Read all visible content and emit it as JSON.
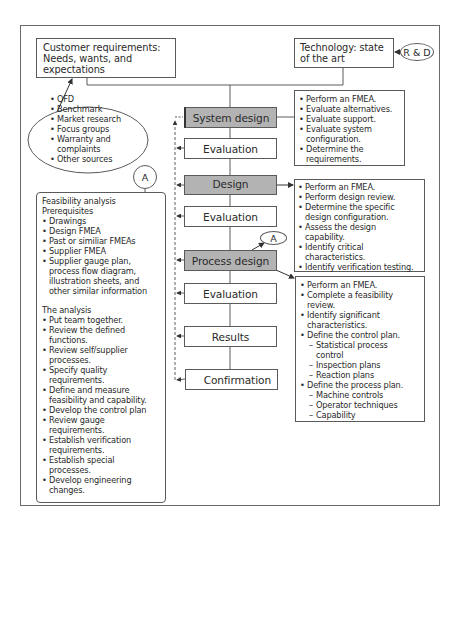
{
  "diagram": {
    "customer_box": {
      "label": "Customer requirements: Needs, wants, and expectations"
    },
    "technology_box": {
      "label": "Technology: state of the art"
    },
    "rd_node": {
      "label": "R & D"
    },
    "sources_ellipse": {
      "items": [
        "QFD",
        "Benchmark",
        "Market research",
        "Focus groups",
        "Warranty and complaints",
        "Other sources"
      ]
    },
    "flow_nodes": [
      {
        "label": "System design",
        "style": "shaded"
      },
      {
        "label": "Evaluation",
        "style": "plain"
      },
      {
        "label": "Design",
        "style": "shaded"
      },
      {
        "label": "Evaluation",
        "style": "plain"
      },
      {
        "label": "Process design",
        "style": "shaded"
      },
      {
        "label": "Evaluation",
        "style": "plain"
      },
      {
        "label": "Results",
        "style": "plain"
      },
      {
        "label": "Confirmation",
        "style": "plain"
      }
    ],
    "connector_a": {
      "label": "A"
    },
    "system_design_tasks": [
      "Perform an FMEA.",
      "Evaluate alternatives.",
      "Evaluate support.",
      "Evaluate system configuration.",
      "Determine the requirements."
    ],
    "design_tasks": [
      "Perform an FMEA.",
      "Perform design review.",
      "Determine the specific design configuration.",
      "Assess the design capability.",
      "Identify critical characteristics.",
      "Identify verification testing."
    ],
    "process_design_tasks": {
      "items": [
        "Perform an FMEA.",
        "Complete a feasibility review.",
        "Identify significant characteristics.",
        "Define the control plan."
      ],
      "control_plan_sub": [
        "Statistical process control",
        "Inspection plans",
        "Reaction plans"
      ],
      "process_plan": "Define the process plan.",
      "process_plan_sub": [
        "Machine controls",
        "Operator techniques",
        "Capability"
      ]
    },
    "feasibility_box": {
      "title_line1": "Feasibility analysis",
      "title_line2": "Prerequisites",
      "prerequisites": [
        "Drawings",
        "Design FMEA",
        "Past or similiar FMEAs",
        "Supplier FMEA",
        "Supplier gauge plan, process flow diagram, illustration sheets, and other similar information"
      ],
      "analysis_title": "The analysis",
      "analysis": [
        "Put team together.",
        "Review the defined functions.",
        "Review self/supplier processes.",
        "Specify quality requirements.",
        "Define and measure feasibility and capability.",
        "Develop the control plan",
        "Review gauge requirements.",
        "Establish verification requirements.",
        "Establish special processes.",
        "Develop engineering changes."
      ]
    },
    "colors": {
      "shaded_node": "#b3b3b3",
      "line": "#5a5a5a",
      "frame": "#6a6a6a"
    }
  }
}
